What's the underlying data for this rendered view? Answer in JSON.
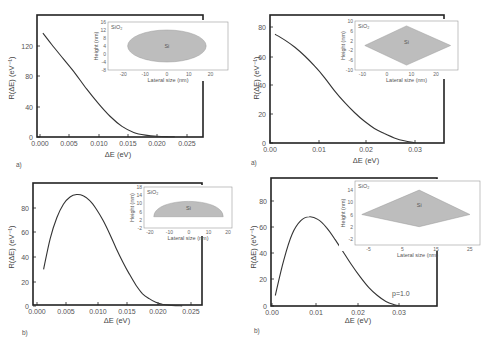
{
  "chart_data": [
    {
      "id": "top-left",
      "panel_label": "a)",
      "type": "line",
      "title": "",
      "xlabel": "ΔE  (eV)",
      "ylabel": "R(ΔE) (eV⁻¹)",
      "xlim": [
        0.0,
        0.0275
      ],
      "ylim": [
        0,
        160
      ],
      "xticks": [
        "0.000",
        "0.005",
        "0.010",
        "0.015",
        "0.020",
        "0.025"
      ],
      "yticks": [
        "0",
        "40",
        "80",
        "120"
      ],
      "grid": false,
      "x": [
        0.0005,
        0.002,
        0.004,
        0.006,
        0.008,
        0.01,
        0.012,
        0.014,
        0.016,
        0.018,
        0.02,
        0.022,
        0.023
      ],
      "values": [
        137,
        122,
        103,
        84,
        63,
        44,
        27,
        14,
        6,
        2.5,
        1,
        0.4,
        0.2
      ],
      "inset": {
        "type": "shape",
        "shape": "ellipse",
        "matrix_label": "SiO₂",
        "core_label": "Si",
        "xlabel": "Lateral size (nm)",
        "ylabel": "Height (nm)",
        "xticks": [
          "-20",
          "-10",
          "0",
          "10",
          "20"
        ],
        "yticks": [
          "-8",
          "-4",
          "0",
          "4",
          "8",
          "12",
          "16"
        ],
        "xlim": [
          -27,
          28
        ],
        "ylim": [
          -8,
          16
        ]
      }
    },
    {
      "id": "top-right",
      "panel_label": "a)",
      "type": "line",
      "title": "",
      "xlabel": "ΔE (eV)",
      "ylabel": "R(ΔE) (eV⁻¹)",
      "xlim": [
        0.0,
        0.035
      ],
      "ylim": [
        0,
        88
      ],
      "xticks": [
        "0.00",
        "0.01",
        "0.02",
        "0.03"
      ],
      "yticks": [
        "0",
        "20",
        "40",
        "60",
        "80"
      ],
      "grid": false,
      "x": [
        0.001,
        0.003,
        0.005,
        0.007,
        0.009,
        0.011,
        0.013,
        0.015,
        0.017,
        0.019,
        0.021,
        0.023,
        0.025,
        0.027,
        0.029
      ],
      "values": [
        75,
        71,
        66,
        60,
        53,
        45,
        36,
        28,
        21,
        15,
        10,
        6.5,
        3.5,
        1.5,
        0.3
      ],
      "inset": {
        "type": "shape",
        "shape": "rhombus",
        "matrix_label": "SiO₂",
        "core_label": "Si",
        "xlabel": "Lateral size (nm)",
        "ylabel": "Height (nm)",
        "xticks": [
          "-10",
          "0",
          "10",
          "20"
        ],
        "yticks": [
          "-10",
          "-6",
          "-2",
          "2",
          "6",
          "10"
        ],
        "xlim": [
          -13,
          29
        ],
        "ylim": [
          -10,
          10
        ]
      }
    },
    {
      "id": "bottom-left",
      "panel_label": "b)",
      "type": "line",
      "title": "",
      "xlabel": "ΔE  (eV)",
      "ylabel": "R(ΔE) (eV⁻¹)",
      "xlim": [
        0.0,
        0.025
      ],
      "ylim": [
        0,
        98
      ],
      "xticks": [
        "0.000",
        "0.005",
        "0.010",
        "0.015",
        "0.020",
        "0.025"
      ],
      "yticks": [
        "0",
        "20",
        "40",
        "60",
        "80"
      ],
      "grid": false,
      "x": [
        0.001,
        0.002,
        0.003,
        0.004,
        0.005,
        0.006,
        0.007,
        0.008,
        0.009,
        0.01,
        0.011,
        0.012,
        0.013,
        0.014,
        0.015,
        0.016,
        0.017,
        0.018,
        0.019,
        0.02,
        0.021,
        0.022
      ],
      "values": [
        30,
        55,
        72,
        83,
        89,
        91,
        90,
        86,
        79,
        70,
        59,
        47,
        36,
        26,
        17,
        10,
        6,
        3,
        1.5,
        0.7,
        0.3,
        0.1
      ],
      "inset": {
        "type": "shape",
        "shape": "half-ellipse",
        "matrix_label": "SiO₂",
        "core_label": "Si",
        "xlabel": "Lateral size (nm)",
        "ylabel": "Height (nm)",
        "xticks": [
          "-20",
          "-10",
          "0",
          "10",
          "20"
        ],
        "yticks": [
          "-2",
          "2",
          "6",
          "10",
          "14",
          "18"
        ],
        "xlim": [
          -23,
          22
        ],
        "ylim": [
          -2,
          18
        ]
      }
    },
    {
      "id": "bottom-right",
      "panel_label": "b)",
      "type": "line",
      "title": "",
      "xlabel": "ΔE (eV)",
      "ylabel": "R(ΔE) (eV⁻¹)",
      "xlim": [
        0.0,
        0.039
      ],
      "ylim": [
        0,
        95
      ],
      "xticks": [
        "0.00",
        "0.01",
        "0.02",
        "0.03"
      ],
      "yticks": [
        "0",
        "20",
        "40",
        "60",
        "80"
      ],
      "grid": false,
      "annotation": "p=1.0",
      "x": [
        0.001,
        0.003,
        0.005,
        0.007,
        0.009,
        0.011,
        0.013,
        0.015,
        0.017,
        0.019,
        0.021,
        0.023,
        0.025,
        0.027,
        0.029,
        0.03
      ],
      "values": [
        8,
        35,
        55,
        65,
        68,
        66,
        60,
        51,
        41,
        31,
        22,
        14,
        8,
        3.5,
        1,
        0.3
      ],
      "inset": {
        "type": "shape",
        "shape": "rhombus",
        "matrix_label": "SiO₂",
        "core_label": "Si",
        "xlabel": "Lateral size (nm)",
        "ylabel": "Height (nm)",
        "xticks": [
          "-5",
          "5",
          "15",
          "25"
        ],
        "yticks": [
          "-2",
          "2",
          "6",
          "10",
          "14"
        ],
        "xlim": [
          -9,
          28
        ],
        "ylim": [
          -4,
          17
        ]
      }
    }
  ]
}
